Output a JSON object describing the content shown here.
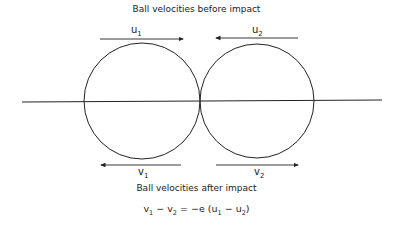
{
  "diagram": {
    "title_before": "Ball velocities before impact",
    "title_after": "Ball velocities after impact",
    "labels": {
      "u1": {
        "base": "u",
        "sub": "1"
      },
      "u2": {
        "base": "u",
        "sub": "2"
      },
      "v1": {
        "base": "v",
        "sub": "1"
      },
      "v2": {
        "base": "v",
        "sub": "2"
      }
    },
    "equation": {
      "parts": [
        "v",
        "1",
        " − v",
        "2",
        " = −e (u",
        "1",
        " − u",
        "2",
        ")"
      ]
    },
    "balls": [
      {
        "name": "ball-1",
        "cx": 142,
        "cy": 101,
        "r": 58
      },
      {
        "name": "ball-2",
        "cx": 257,
        "cy": 101,
        "r": 57
      }
    ],
    "colors": {
      "stroke": "#222222",
      "background": "#ffffff"
    }
  }
}
